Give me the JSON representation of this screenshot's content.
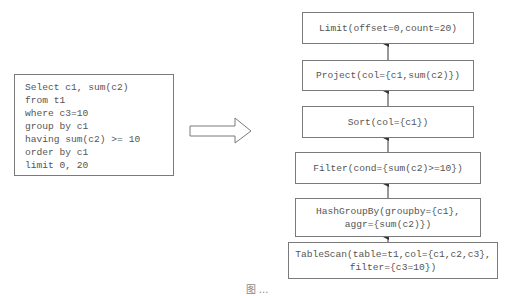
{
  "sql_query": {
    "lines": [
      "Select c1, sum(c2)",
      "from t1",
      "where c3=10",
      "group by c1",
      "having sum(c2) >= 10",
      "order by c1",
      "limit 0, 20"
    ]
  },
  "transform_arrow": {
    "icon": "right-arrow-icon"
  },
  "plan": {
    "nodes": [
      {
        "id": "limit",
        "lines": [
          "Limit(offset=0,count=20)"
        ]
      },
      {
        "id": "project",
        "lines": [
          "Project(col={c1,sum(c2)})"
        ]
      },
      {
        "id": "sort",
        "lines": [
          "Sort(col={c1})"
        ]
      },
      {
        "id": "filter",
        "lines": [
          "Filter(cond={sum(c2)>=10})"
        ]
      },
      {
        "id": "hashgroupby",
        "lines": [
          "HashGroupBy(groupby={c1},",
          "aggr={sum(c2)})"
        ]
      },
      {
        "id": "tablescan",
        "lines": [
          "TableScan(table=t1,col={c1,c2,c3},",
          "filter={c3=10})"
        ]
      }
    ],
    "edges": [
      {
        "from": "tablescan",
        "to": "hashgroupby"
      },
      {
        "from": "hashgroupby",
        "to": "filter"
      },
      {
        "from": "filter",
        "to": "sort"
      },
      {
        "from": "sort",
        "to": "project"
      },
      {
        "from": "project",
        "to": "limit"
      }
    ]
  },
  "caption": "图 ..."
}
